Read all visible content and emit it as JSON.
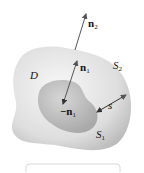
{
  "diagram": {
    "region_label": "D",
    "outer_surface": {
      "label": "S",
      "sub": "2"
    },
    "inner_surface": {
      "label": "S",
      "sub": "1"
    },
    "outer_normal": {
      "label": "n",
      "sub": "2"
    },
    "inner_normal": {
      "label": "n",
      "sub": "1"
    },
    "inner_normal_neg": {
      "label": "−n",
      "sub": "1"
    },
    "separation": {
      "label": "s"
    },
    "colors": {
      "outer_fill": "#d9d9d9",
      "inner_fill": "#bdbdbd",
      "arrow": "#555555",
      "text": "#111111"
    }
  }
}
